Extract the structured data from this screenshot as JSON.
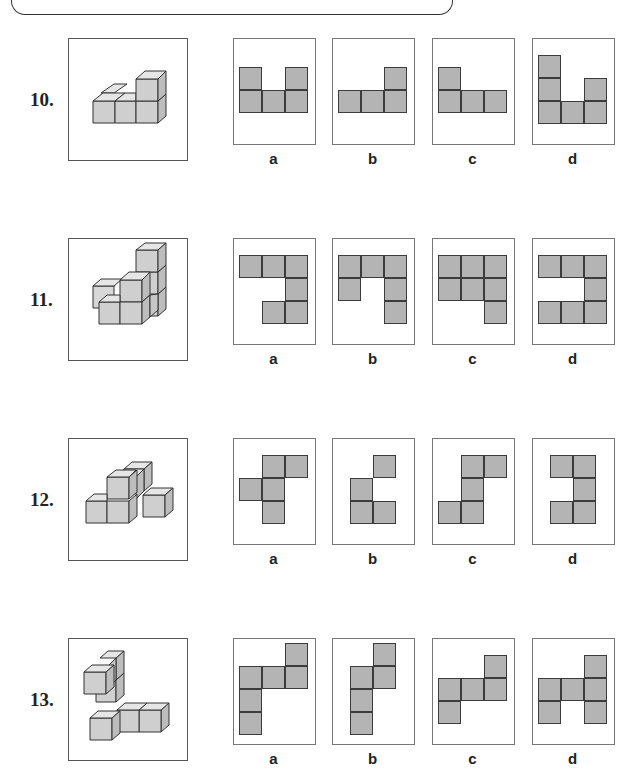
{
  "colors": {
    "net_fill": "#b4b4b4",
    "net_line": "#3c3c3c",
    "cube_front": "#cfcfcf",
    "cube_top": "#e6e6e6",
    "cube_side": "#bdbdbd"
  },
  "questions": [
    {
      "number": "10.",
      "top": 38,
      "options": [
        {
          "label": "a",
          "origin": [
            5,
            28
          ],
          "cells": [
            [
              0,
              0
            ],
            [
              0,
              2
            ],
            [
              1,
              0
            ],
            [
              1,
              1
            ],
            [
              1,
              2
            ]
          ]
        },
        {
          "label": "b",
          "origin": [
            5,
            28
          ],
          "cells": [
            [
              0,
              2
            ],
            [
              1,
              0
            ],
            [
              1,
              1
            ],
            [
              1,
              2
            ]
          ]
        },
        {
          "label": "c",
          "origin": [
            5,
            28
          ],
          "cells": [
            [
              0,
              0
            ],
            [
              1,
              0
            ],
            [
              1,
              1
            ],
            [
              1,
              2
            ]
          ]
        },
        {
          "label": "d",
          "origin": [
            5,
            16
          ],
          "cells": [
            [
              0,
              0
            ],
            [
              1,
              0
            ],
            [
              1,
              2
            ],
            [
              2,
              0
            ],
            [
              2,
              1
            ],
            [
              2,
              2
            ]
          ]
        }
      ]
    },
    {
      "number": "11.",
      "top": 238,
      "options": [
        {
          "label": "a",
          "origin": [
            5,
            16
          ],
          "cells": [
            [
              0,
              0
            ],
            [
              0,
              1
            ],
            [
              0,
              2
            ],
            [
              1,
              2
            ],
            [
              2,
              1
            ],
            [
              2,
              2
            ]
          ]
        },
        {
          "label": "b",
          "origin": [
            5,
            16
          ],
          "cells": [
            [
              0,
              0
            ],
            [
              0,
              1
            ],
            [
              0,
              2
            ],
            [
              1,
              0
            ],
            [
              1,
              2
            ],
            [
              2,
              2
            ]
          ]
        },
        {
          "label": "c",
          "origin": [
            5,
            16
          ],
          "cells": [
            [
              0,
              0
            ],
            [
              0,
              1
            ],
            [
              0,
              2
            ],
            [
              1,
              0
            ],
            [
              1,
              1
            ],
            [
              1,
              2
            ],
            [
              2,
              2
            ]
          ]
        },
        {
          "label": "d",
          "origin": [
            5,
            16
          ],
          "cells": [
            [
              0,
              0
            ],
            [
              0,
              1
            ],
            [
              0,
              2
            ],
            [
              1,
              2
            ],
            [
              2,
              0
            ],
            [
              2,
              1
            ],
            [
              2,
              2
            ]
          ]
        }
      ]
    },
    {
      "number": "12.",
      "top": 438,
      "options": [
        {
          "label": "a",
          "origin": [
            5,
            16
          ],
          "cells": [
            [
              0,
              1
            ],
            [
              0,
              2
            ],
            [
              1,
              0
            ],
            [
              1,
              1
            ],
            [
              2,
              1
            ]
          ]
        },
        {
          "label": "b",
          "origin": [
            17,
            16
          ],
          "cells": [
            [
              0,
              1
            ],
            [
              1,
              0
            ],
            [
              2,
              0
            ],
            [
              2,
              1
            ]
          ]
        },
        {
          "label": "c",
          "origin": [
            5,
            16
          ],
          "cells": [
            [
              0,
              1
            ],
            [
              0,
              2
            ],
            [
              1,
              1
            ],
            [
              2,
              0
            ],
            [
              2,
              1
            ]
          ]
        },
        {
          "label": "d",
          "origin": [
            17,
            16
          ],
          "cells": [
            [
              0,
              0
            ],
            [
              0,
              1
            ],
            [
              1,
              1
            ],
            [
              2,
              0
            ],
            [
              2,
              1
            ]
          ]
        }
      ]
    },
    {
      "number": "13.",
      "top": 638,
      "options": [
        {
          "label": "a",
          "origin": [
            5,
            4
          ],
          "cells": [
            [
              0,
              2
            ],
            [
              1,
              0
            ],
            [
              1,
              1
            ],
            [
              1,
              2
            ],
            [
              2,
              0
            ],
            [
              3,
              0
            ]
          ]
        },
        {
          "label": "b",
          "origin": [
            17,
            4
          ],
          "cells": [
            [
              0,
              1
            ],
            [
              1,
              0
            ],
            [
              1,
              1
            ],
            [
              2,
              0
            ],
            [
              3,
              0
            ]
          ]
        },
        {
          "label": "c",
          "origin": [
            5,
            16
          ],
          "cells": [
            [
              0,
              2
            ],
            [
              1,
              0
            ],
            [
              1,
              1
            ],
            [
              1,
              2
            ],
            [
              2,
              0
            ]
          ]
        },
        {
          "label": "d",
          "origin": [
            5,
            16
          ],
          "cells": [
            [
              0,
              2
            ],
            [
              1,
              0
            ],
            [
              1,
              1
            ],
            [
              1,
              2
            ],
            [
              2,
              0
            ],
            [
              2,
              2
            ]
          ]
        }
      ]
    }
  ]
}
